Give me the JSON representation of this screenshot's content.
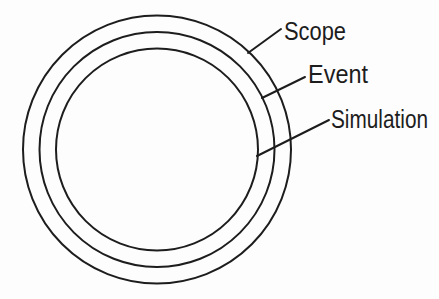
{
  "diagram": {
    "type": "concentric-circles",
    "background_color": "#fdfdfd",
    "stroke_color": "#1d1d1d",
    "text_color": "#1d1d1d",
    "rings": [
      {
        "position": "outer",
        "label": "Scope"
      },
      {
        "position": "middle",
        "label": "Event"
      },
      {
        "position": "inner",
        "label": "Simulation"
      }
    ]
  }
}
